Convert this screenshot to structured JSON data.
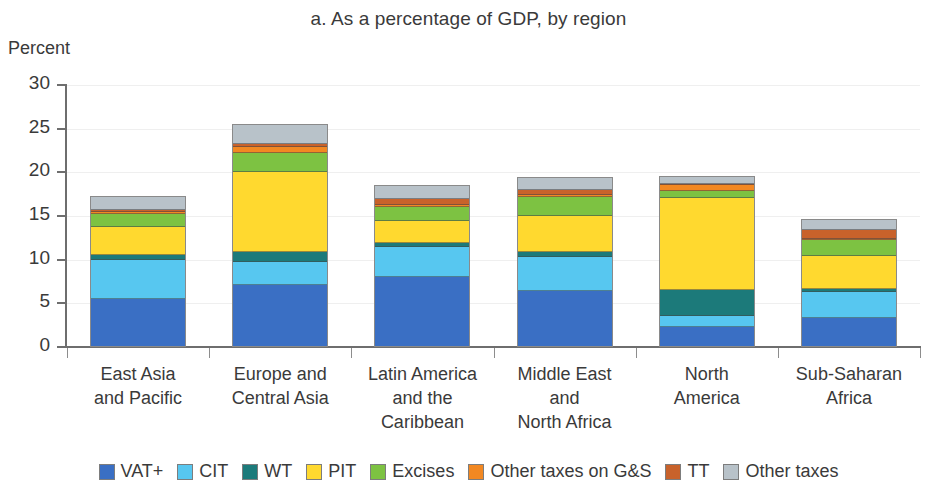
{
  "chart_data": {
    "type": "bar",
    "subtype": "stacked-bar",
    "title": "a. As a percentage of GDP, by region",
    "xlabel": "",
    "ylabel": "Percent",
    "ylim": [
      0,
      30
    ],
    "yticks": [
      0,
      5,
      10,
      15,
      20,
      25,
      30
    ],
    "ytick_labels": [
      "0",
      "5",
      "10",
      "15",
      "20",
      "25",
      "30"
    ],
    "grid": true,
    "legend_position": "bottom",
    "categories": [
      "East Asia and Pacific",
      "Europe and Central Asia",
      "Latin America and the Caribbean",
      "Middle East and North Africa",
      "North America",
      "Sub-Saharan Africa"
    ],
    "category_lines": [
      [
        "East Asia",
        "and Pacific"
      ],
      [
        "Europe and",
        "Central Asia"
      ],
      [
        "Latin America",
        "and the",
        "Caribbean"
      ],
      [
        "Middle East",
        "and",
        "North Africa"
      ],
      [
        "North",
        "America"
      ],
      [
        "Sub-Saharan",
        "Africa"
      ]
    ],
    "series": [
      {
        "name": "VAT+",
        "color": "#3A6FC4",
        "values": [
          5.4,
          7.1,
          8.0,
          6.4,
          2.2,
          3.3
        ]
      },
      {
        "name": "CIT",
        "color": "#57C7F0",
        "values": [
          4.6,
          2.6,
          3.5,
          3.9,
          1.3,
          3.0
        ]
      },
      {
        "name": "WT",
        "color": "#1C7A7A",
        "values": [
          0.6,
          1.2,
          0.5,
          0.6,
          3.0,
          0.3
        ]
      },
      {
        "name": "PIT",
        "color": "#FFD92F",
        "values": [
          3.2,
          9.2,
          2.5,
          4.2,
          10.7,
          3.9
        ]
      },
      {
        "name": "Excises",
        "color": "#7DC242",
        "values": [
          1.5,
          2.2,
          1.6,
          2.2,
          0.7,
          1.8
        ]
      },
      {
        "name": "Other taxes on G&S",
        "color": "#F28822",
        "values": [
          0.2,
          0.7,
          0.3,
          0.2,
          0.7,
          0.2
        ]
      },
      {
        "name": "TT",
        "color": "#C8622B",
        "values": [
          0.3,
          0.3,
          0.7,
          0.6,
          0.2,
          1.0
        ]
      },
      {
        "name": "Other taxes",
        "color": "#B8C2C9",
        "values": [
          1.5,
          2.2,
          1.4,
          1.4,
          0.8,
          1.1
        ]
      }
    ],
    "totals": [
      17.3,
      25.5,
      18.5,
      19.5,
      19.6,
      14.6
    ]
  },
  "legend": {
    "items": [
      {
        "label": "VAT+"
      },
      {
        "label": "CIT"
      },
      {
        "label": "WT"
      },
      {
        "label": "PIT"
      },
      {
        "label": "Excises"
      },
      {
        "label": "Other taxes on G&S"
      },
      {
        "label": "TT"
      },
      {
        "label": "Other taxes"
      }
    ]
  }
}
